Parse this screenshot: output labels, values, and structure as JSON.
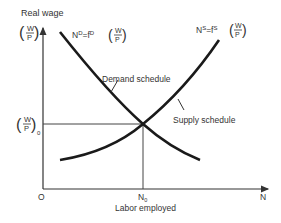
{
  "diagram": {
    "y_axis": {
      "label": "Real wage",
      "symbol_num": "W",
      "symbol_den": "P"
    },
    "x_axis": {
      "label": "Labor employed",
      "end_label": "N",
      "origin_label": "O"
    },
    "equilibrium": {
      "x_label": "N",
      "x_label_sub": "0",
      "y_label_num": "W",
      "y_label_den": "P",
      "y_label_sub": "0"
    },
    "demand": {
      "equation_lhs": "N",
      "equation_lhs_sup": "D",
      "equation_mid": "=f",
      "equation_mid_sup": "D",
      "name": "Demand schedule"
    },
    "supply": {
      "equation_lhs": "N",
      "equation_lhs_sup": "S",
      "equation_mid": "=f",
      "equation_mid_sup": "S",
      "name": "Supply schedule"
    },
    "colors": {
      "curve": "#1a1a1a",
      "axis": "#333333"
    }
  }
}
